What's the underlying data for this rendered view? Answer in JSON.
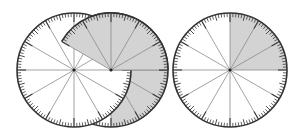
{
  "diagram": {
    "title": "Fraction dials",
    "width": 301,
    "height": 139,
    "colors": {
      "background": "#ffffff",
      "disc_fill": "#ffffff",
      "shade": "#d3d3d3",
      "rim": "#333333",
      "tick": "#3a3a3a",
      "spoke": "#8a8a8a",
      "center_dot": "#222222"
    },
    "tick_spec": {
      "count": 120,
      "minor_len": 4,
      "mid_every": 5,
      "mid_len": 6,
      "major_every": 10,
      "major_len": 9
    },
    "spokes_count": 12,
    "dials": [
      {
        "id": "left-dial",
        "cx": 74,
        "cy": 70,
        "r": 57,
        "shaded_from_deg": null,
        "shaded_to_deg": null,
        "label": "whole unshaded dial"
      },
      {
        "id": "middle-dial",
        "cx": 111,
        "cy": 70,
        "r": 57,
        "shaded_from_deg": -150,
        "shaded_to_deg": 90,
        "label": "dial with 8/12 shaded sector"
      },
      {
        "id": "right-dial",
        "cx": 230,
        "cy": 70,
        "r": 57,
        "shaded_from_deg": -90,
        "shaded_to_deg": 0,
        "label": "dial with 3/12 shaded sector"
      }
    ]
  }
}
